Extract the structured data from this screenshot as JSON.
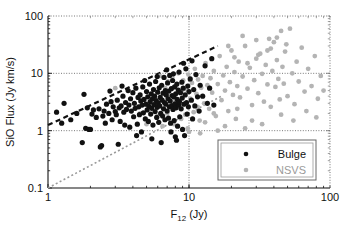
{
  "chart_data": {
    "type": "scatter",
    "title": "",
    "xlabel": "F12 (Jy)",
    "xlabel_main": "F",
    "xlabel_sub": "12",
    "xlabel_unit": " (Jy)",
    "ylabel": "SiO Flux (Jy km/s)",
    "xscale": "log",
    "yscale": "log",
    "xlim": [
      1,
      100
    ],
    "ylim": [
      0.1,
      100
    ],
    "xticks": [
      "1",
      "10",
      "100"
    ],
    "xtick_values": [
      1,
      10,
      100
    ],
    "yticks": [
      "0.1",
      "1",
      "10",
      "100"
    ],
    "ytick_values": [
      0.1,
      1,
      10,
      100
    ],
    "grid": true,
    "grid_style": "dotted",
    "legend_position": "bottom-right",
    "legend": [
      {
        "label": "Bulge",
        "color": "#111111",
        "marker": "circle"
      },
      {
        "label": "NSVS",
        "color": "#b4b4b4",
        "marker": "circle"
      }
    ],
    "series": [
      {
        "name": "Bulge",
        "color": "#111111",
        "marker": "circle",
        "marker_size": 2.6,
        "points": [
          [
            1.15,
            2.1
          ],
          [
            1.25,
            1.35
          ],
          [
            1.3,
            3.0
          ],
          [
            1.45,
            1.55
          ],
          [
            1.6,
            2.0
          ],
          [
            1.75,
            0.62
          ],
          [
            1.8,
            4.3
          ],
          [
            1.85,
            1.1
          ],
          [
            1.9,
            2.5
          ],
          [
            1.95,
            1.05
          ],
          [
            2.0,
            1.05
          ],
          [
            2.05,
            1.95
          ],
          [
            2.1,
            2.3
          ],
          [
            2.2,
            1.7
          ],
          [
            2.3,
            2.4
          ],
          [
            2.4,
            0.55
          ],
          [
            2.45,
            1.8
          ],
          [
            2.5,
            2.2
          ],
          [
            2.55,
            1.35
          ],
          [
            2.6,
            2.9
          ],
          [
            2.7,
            2.0
          ],
          [
            2.8,
            3.2
          ],
          [
            2.85,
            1.55
          ],
          [
            2.9,
            2.6
          ],
          [
            3.0,
            2.15
          ],
          [
            3.05,
            1.9
          ],
          [
            3.1,
            3.4
          ],
          [
            3.2,
            2.5
          ],
          [
            3.25,
            1.45
          ],
          [
            3.3,
            2.7
          ],
          [
            3.4,
            4.0
          ],
          [
            3.45,
            2.1
          ],
          [
            3.5,
            1.25
          ],
          [
            3.55,
            3.1
          ],
          [
            3.6,
            2.35
          ],
          [
            3.7,
            5.0
          ],
          [
            3.75,
            2.8
          ],
          [
            3.8,
            1.15
          ],
          [
            3.85,
            3.6
          ],
          [
            3.9,
            2.2
          ],
          [
            4.0,
            4.6
          ],
          [
            4.05,
            1.75
          ],
          [
            4.1,
            3.0
          ],
          [
            4.15,
            2.45
          ],
          [
            4.2,
            5.5
          ],
          [
            4.3,
            1.3
          ],
          [
            4.35,
            3.8
          ],
          [
            4.4,
            2.6
          ],
          [
            4.45,
            1.9
          ],
          [
            4.5,
            4.2
          ],
          [
            4.55,
            3.3
          ],
          [
            4.6,
            0.95
          ],
          [
            4.65,
            2.8
          ],
          [
            4.7,
            5.8
          ],
          [
            4.75,
            2.05
          ],
          [
            4.8,
            3.5
          ],
          [
            4.9,
            1.6
          ],
          [
            4.95,
            2.9
          ],
          [
            5.0,
            4.8
          ],
          [
            5.05,
            2.3
          ],
          [
            5.1,
            3.9
          ],
          [
            5.15,
            1.45
          ],
          [
            5.2,
            2.65
          ],
          [
            5.25,
            6.5
          ],
          [
            5.3,
            3.2
          ],
          [
            5.35,
            1.95
          ],
          [
            5.4,
            4.4
          ],
          [
            5.45,
            2.45
          ],
          [
            5.5,
            3.6
          ],
          [
            5.55,
            1.25
          ],
          [
            5.6,
            5.2
          ],
          [
            5.65,
            2.85
          ],
          [
            5.7,
            4.0
          ],
          [
            5.75,
            2.15
          ],
          [
            5.8,
            7.2
          ],
          [
            5.85,
            3.35
          ],
          [
            5.9,
            1.7
          ],
          [
            5.95,
            2.55
          ],
          [
            6.0,
            4.7
          ],
          [
            6.05,
            3.05
          ],
          [
            6.1,
            1.4
          ],
          [
            6.15,
            5.6
          ],
          [
            6.2,
            2.7
          ],
          [
            6.25,
            3.8
          ],
          [
            6.3,
            2.0
          ],
          [
            6.4,
            6.2
          ],
          [
            6.45,
            3.4
          ],
          [
            6.5,
            1.8
          ],
          [
            6.55,
            4.5
          ],
          [
            6.6,
            2.4
          ],
          [
            6.65,
            8.5
          ],
          [
            6.7,
            3.1
          ],
          [
            6.75,
            1.55
          ],
          [
            6.8,
            5.0
          ],
          [
            6.85,
            2.9
          ],
          [
            6.9,
            4.2
          ],
          [
            7.0,
            2.2
          ],
          [
            7.05,
            6.8
          ],
          [
            7.1,
            3.6
          ],
          [
            7.15,
            1.65
          ],
          [
            7.2,
            4.9
          ],
          [
            7.25,
            2.6
          ],
          [
            7.3,
            9.2
          ],
          [
            7.35,
            3.3
          ],
          [
            7.4,
            1.35
          ],
          [
            7.5,
            5.4
          ],
          [
            7.55,
            2.75
          ],
          [
            7.6,
            4.1
          ],
          [
            7.65,
            7.5
          ],
          [
            7.7,
            2.35
          ],
          [
            7.8,
            3.9
          ],
          [
            7.85,
            1.5
          ],
          [
            7.9,
            5.8
          ],
          [
            7.95,
            2.95
          ],
          [
            8.0,
            0.78
          ],
          [
            8.05,
            4.4
          ],
          [
            8.1,
            2.5
          ],
          [
            8.2,
            6.5
          ],
          [
            8.25,
            3.5
          ],
          [
            8.3,
            1.2
          ],
          [
            8.4,
            5.1
          ],
          [
            8.45,
            2.8
          ],
          [
            8.5,
            10.5
          ],
          [
            8.55,
            3.2
          ],
          [
            8.6,
            1.75
          ],
          [
            8.7,
            4.6
          ],
          [
            8.8,
            2.4
          ],
          [
            8.9,
            7.0
          ],
          [
            8.95,
            3.7
          ],
          [
            9.0,
            1.05
          ],
          [
            9.1,
            5.5
          ],
          [
            9.2,
            2.9
          ],
          [
            9.3,
            0.82
          ],
          [
            9.4,
            4.2
          ],
          [
            9.5,
            12.0
          ],
          [
            9.6,
            3.1
          ],
          [
            9.7,
            1.95
          ],
          [
            9.8,
            6.0
          ],
          [
            9.9,
            2.6
          ],
          [
            10.0,
            4.8
          ],
          [
            10.2,
            8.0
          ],
          [
            10.4,
            3.4
          ],
          [
            10.6,
            1.6
          ],
          [
            10.8,
            5.2
          ],
          [
            11.0,
            2.7
          ],
          [
            11.2,
            9.5
          ],
          [
            11.5,
            3.9
          ],
          [
            11.8,
            2.2
          ],
          [
            12.0,
            6.2
          ],
          [
            12.5,
            4.0
          ],
          [
            13.0,
            13.5
          ],
          [
            13.5,
            3.0
          ],
          [
            14.0,
            5.5
          ],
          [
            14.5,
            18.0
          ],
          [
            15.0,
            2.8
          ],
          [
            2.35,
            0.52
          ],
          [
            3.15,
            0.58
          ],
          [
            4.25,
            0.82
          ],
          [
            5.45,
            0.72
          ],
          [
            6.35,
            0.62
          ],
          [
            7.45,
            0.95
          ],
          [
            8.15,
            0.68
          ],
          [
            2.75,
            4.9
          ],
          [
            3.35,
            6.0
          ],
          [
            4.85,
            7.5
          ],
          [
            5.95,
            8.8
          ],
          [
            6.95,
            11.5
          ],
          [
            7.75,
            9.8
          ],
          [
            9.15,
            15.0
          ],
          [
            10.5,
            16.5
          ]
        ]
      },
      {
        "name": "NSVS",
        "color": "#b4b4b4",
        "marker": "circle",
        "marker_size": 2.4,
        "points": [
          [
            6.2,
            9.0
          ],
          [
            6.8,
            5.5
          ],
          [
            7.1,
            7.2
          ],
          [
            7.4,
            4.0
          ],
          [
            7.6,
            8.5
          ],
          [
            7.9,
            3.2
          ],
          [
            8.1,
            6.0
          ],
          [
            8.4,
            10.0
          ],
          [
            8.6,
            2.5
          ],
          [
            8.9,
            4.8
          ],
          [
            9.1,
            7.5
          ],
          [
            9.4,
            1.9
          ],
          [
            9.6,
            5.2
          ],
          [
            9.9,
            9.5
          ],
          [
            10.2,
            3.6
          ],
          [
            10.5,
            6.8
          ],
          [
            10.8,
            2.1
          ],
          [
            11.0,
            12.0
          ],
          [
            11.3,
            4.4
          ],
          [
            11.6,
            7.8
          ],
          [
            11.9,
            1.5
          ],
          [
            12.2,
            5.6
          ],
          [
            12.5,
            9.0
          ],
          [
            12.8,
            3.0
          ],
          [
            13.1,
            15.0
          ],
          [
            13.5,
            6.2
          ],
          [
            13.9,
            2.4
          ],
          [
            14.2,
            8.2
          ],
          [
            14.6,
            4.6
          ],
          [
            15.0,
            11.0
          ],
          [
            15.5,
            1.8
          ],
          [
            16.0,
            6.5
          ],
          [
            16.5,
            20.0
          ],
          [
            17.0,
            3.4
          ],
          [
            17.5,
            9.2
          ],
          [
            18.0,
            5.0
          ],
          [
            18.5,
            13.0
          ],
          [
            19.0,
            2.2
          ],
          [
            19.5,
            7.0
          ],
          [
            20.0,
            25.0
          ],
          [
            20.5,
            4.2
          ],
          [
            21.0,
            10.5
          ],
          [
            21.5,
            1.6
          ],
          [
            22.0,
            6.0
          ],
          [
            22.5,
            16.0
          ],
          [
            23.0,
            3.8
          ],
          [
            24.0,
            8.8
          ],
          [
            25.0,
            30.0
          ],
          [
            26.0,
            5.4
          ],
          [
            27.0,
            12.5
          ],
          [
            28.0,
            2.8
          ],
          [
            29.0,
            7.6
          ],
          [
            30.0,
            18.0
          ],
          [
            31.0,
            4.5
          ],
          [
            32.0,
            22.0
          ],
          [
            33.0,
            9.8
          ],
          [
            34.0,
            3.2
          ],
          [
            35.0,
            14.0
          ],
          [
            36.0,
            6.4
          ],
          [
            37.0,
            40.0
          ],
          [
            38.0,
            2.6
          ],
          [
            39.0,
            11.0
          ],
          [
            40.0,
            35.0
          ],
          [
            41.0,
            5.8
          ],
          [
            42.0,
            17.0
          ],
          [
            43.0,
            8.0
          ],
          [
            44.0,
            3.5
          ],
          [
            45.0,
            55.0
          ],
          [
            46.0,
            13.0
          ],
          [
            47.0,
            6.6
          ],
          [
            48.0,
            24.0
          ],
          [
            50.0,
            4.0
          ],
          [
            52.0,
            60.0
          ],
          [
            54.0,
            10.0
          ],
          [
            56.0,
            2.9
          ],
          [
            58.0,
            16.0
          ],
          [
            60.0,
            7.2
          ],
          [
            63.0,
            28.0
          ],
          [
            66.0,
            4.8
          ],
          [
            70.0,
            12.0
          ],
          [
            74.0,
            6.0
          ],
          [
            78.0,
            20.0
          ],
          [
            82.0,
            3.6
          ],
          [
            86.0,
            9.0
          ],
          [
            90.0,
            5.0
          ],
          [
            7.0,
            2.0
          ],
          [
            7.8,
            1.3
          ],
          [
            8.8,
            1.6
          ],
          [
            9.8,
            1.1
          ],
          [
            11.5,
            2.6
          ],
          [
            13.0,
            1.4
          ],
          [
            15.0,
            2.0
          ],
          [
            18.0,
            1.2
          ],
          [
            22.0,
            2.4
          ],
          [
            28.0,
            1.5
          ],
          [
            3.0,
            5.5
          ],
          [
            4.5,
            2.0
          ],
          [
            5.0,
            1.3
          ],
          [
            5.5,
            3.0
          ],
          [
            6.0,
            1.8
          ],
          [
            6.5,
            1.2
          ],
          [
            10.0,
            0.95
          ],
          [
            12.0,
            0.9
          ],
          [
            16.0,
            1.0
          ],
          [
            25.0,
            1.1
          ],
          [
            33.0,
            1.3
          ],
          [
            45.0,
            1.9
          ],
          [
            55.0,
            1.5
          ],
          [
            68.0,
            2.2
          ],
          [
            80.0,
            1.7
          ],
          [
            24.0,
            45.0
          ],
          [
            30.0,
            38.0
          ],
          [
            36.0,
            25.0
          ],
          [
            42.0,
            42.0
          ],
          [
            49.0,
            32.0
          ],
          [
            19.0,
            30.0
          ],
          [
            21.0,
            19.0
          ],
          [
            26.0,
            15.0
          ],
          [
            31.0,
            21.0
          ],
          [
            38.0,
            27.0
          ]
        ]
      }
    ],
    "trend_lines": [
      {
        "name": "bulge-trend",
        "color": "#111111",
        "style": "dashed",
        "width": 2.2,
        "from": [
          1.0,
          1.25
        ],
        "to": [
          16.0,
          30.0
        ]
      },
      {
        "name": "nsvs-trend",
        "color": "#9a9a9a",
        "style": "dashed",
        "width": 1.6,
        "from": [
          1.0,
          0.1
        ],
        "to": [
          17.0,
          4.0
        ]
      }
    ]
  }
}
